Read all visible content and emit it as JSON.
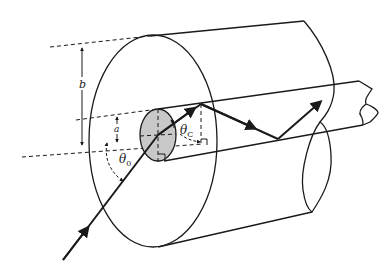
{
  "diagram": {
    "title": "",
    "type": "optical fiber acceptance angle diagram",
    "labels": {
      "outer_radius": "b",
      "core_radius": "a",
      "acceptance_angle": "θ",
      "acceptance_angle_sub": "0",
      "critical_angle": "θ",
      "critical_angle_sub": "C"
    },
    "colors": {
      "line": "#1a1a1a",
      "core_fill": "#c8c8c8",
      "background": "#ffffff"
    },
    "components": [
      "outer cladding cylinder",
      "inner core cylinder",
      "incident light ray",
      "totally internally reflected ray"
    ]
  }
}
